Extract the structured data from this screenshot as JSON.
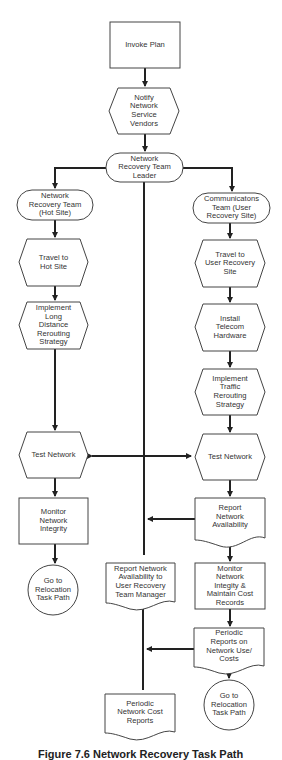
{
  "diagram": {
    "type": "flowchart",
    "caption": "Figure 7.6 Network Recovery Task Path",
    "nodes": {
      "invoke_plan": {
        "label": "Invoke Plan",
        "shape": "process"
      },
      "notify_vendors": {
        "label": "Notify\nNetwork\nService\nVendors",
        "shape": "preparation"
      },
      "team_leader": {
        "label": "Network\nRecovery Team\nLeader",
        "shape": "terminator"
      },
      "network_team": {
        "label": "Network\nRecovery Team\n(Hot Site)",
        "shape": "terminator"
      },
      "comms_team": {
        "label": "Communicatons\nTeam (User\nRecovery Site)",
        "shape": "terminator"
      },
      "travel_hot_site": {
        "label": "Travel to\nHot Site",
        "shape": "preparation"
      },
      "implement_long_distance": {
        "label": "Implement\nLong\nDistance\nRerouting\nStrategy",
        "shape": "preparation"
      },
      "travel_user_site": {
        "label": "Travel to\nUser Recovery\nSite",
        "shape": "preparation"
      },
      "install_telecom": {
        "label": "Install\nTelecom\nHardware",
        "shape": "preparation"
      },
      "implement_traffic": {
        "label": "Implement\nTraffic\nRerouting\nStrategy",
        "shape": "preparation"
      },
      "test_network_left": {
        "label": "Test Network",
        "shape": "preparation"
      },
      "test_network_right": {
        "label": "Test Network",
        "shape": "preparation"
      },
      "monitor_integrity": {
        "label": "Monitor\nNetwork\nIntegrity",
        "shape": "process"
      },
      "report_availability": {
        "label": "Report\nNetwork\nAvailability",
        "shape": "document"
      },
      "goto_relocation_left": {
        "label": "Go to\nRelocation\nTask Path",
        "shape": "connector"
      },
      "report_to_manager": {
        "label": "Report Network\nAvailability to\nUser Recovery\nTeam Manager",
        "shape": "document"
      },
      "monitor_cost": {
        "label": "Monitor\nNetwork\nIntegity &\nMaintain Cost\nRecords",
        "shape": "process"
      },
      "periodic_use_costs": {
        "label": "Periodic\nReports on\nNetwork Use/\nCosts",
        "shape": "document"
      },
      "periodic_cost_reports": {
        "label": "Periodic\nNetwork Cost\nReports",
        "shape": "document"
      },
      "goto_relocation_right": {
        "label": "Go to\nRelocation\nTask Path",
        "shape": "connector"
      }
    },
    "edges": [
      [
        "invoke_plan",
        "notify_vendors"
      ],
      [
        "notify_vendors",
        "team_leader"
      ],
      [
        "team_leader",
        "network_team"
      ],
      [
        "team_leader",
        "comms_team"
      ],
      [
        "team_leader",
        "report_to_manager"
      ],
      [
        "network_team",
        "travel_hot_site"
      ],
      [
        "travel_hot_site",
        "implement_long_distance"
      ],
      [
        "implement_long_distance",
        "test_network_left"
      ],
      [
        "comms_team",
        "travel_user_site"
      ],
      [
        "travel_user_site",
        "install_telecom"
      ],
      [
        "install_telecom",
        "implement_traffic"
      ],
      [
        "implement_traffic",
        "test_network_right"
      ],
      [
        "test_network_left",
        "test_network_right",
        "bidirectional"
      ],
      [
        "test_network_left",
        "monitor_integrity"
      ],
      [
        "monitor_integrity",
        "goto_relocation_left"
      ],
      [
        "test_network_right",
        "report_availability"
      ],
      [
        "report_availability",
        "team_leader_line"
      ],
      [
        "report_availability",
        "monitor_cost"
      ],
      [
        "monitor_cost",
        "periodic_use_costs"
      ],
      [
        "periodic_use_costs",
        "report_to_manager_line"
      ],
      [
        "periodic_use_costs",
        "goto_relocation_right"
      ],
      [
        "report_to_manager",
        "periodic_cost_reports"
      ]
    ]
  }
}
